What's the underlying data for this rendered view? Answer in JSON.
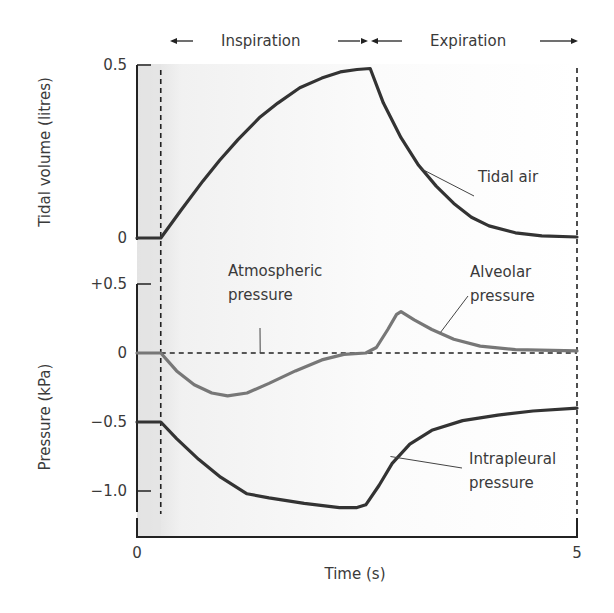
{
  "chart_data": {
    "type": "line",
    "title": "",
    "phases": [
      {
        "label": "Inspiration",
        "start": 0.27,
        "end": 2.65
      },
      {
        "label": "Expiration",
        "start": 2.65,
        "end": 5
      }
    ],
    "xlabel": "Time (s)",
    "xlim": [
      0,
      5
    ],
    "xticks": [
      {
        "value": 0,
        "label": "0"
      },
      {
        "value": 5,
        "label": "5"
      }
    ],
    "grid": false,
    "shaded_region": {
      "from": 0,
      "to": 0.27,
      "color": "#e4e4e4"
    },
    "panels": [
      {
        "id": "volume",
        "ylabel": "Tidal volume (litres)",
        "ylim": [
          0,
          0.5
        ],
        "yticks": [
          {
            "value": 0.5,
            "label": "0.5"
          },
          {
            "value": 0,
            "label": "0"
          }
        ],
        "series": [
          {
            "name": "Tidal air",
            "color": "#333333",
            "points": [
              [
                0,
                0
              ],
              [
                0.27,
                0
              ],
              [
                0.5,
                0.08
              ],
              [
                0.75,
                0.165
              ],
              [
                0.94,
                0.225
              ],
              [
                1.15,
                0.285
              ],
              [
                1.4,
                0.35
              ],
              [
                1.6,
                0.39
              ],
              [
                1.85,
                0.434
              ],
              [
                2.1,
                0.462
              ],
              [
                2.31,
                0.48
              ],
              [
                2.5,
                0.487
              ],
              [
                2.65,
                0.49
              ],
              [
                2.8,
                0.39
              ],
              [
                3.0,
                0.29
              ],
              [
                3.2,
                0.21
              ],
              [
                3.4,
                0.15
              ],
              [
                3.6,
                0.1
              ],
              [
                3.8,
                0.06
              ],
              [
                4.0,
                0.035
              ],
              [
                4.3,
                0.015
              ],
              [
                4.6,
                0.006
              ],
              [
                5.0,
                0.003
              ]
            ]
          }
        ],
        "annotations": [
          {
            "text": [
              "Tidal air"
            ],
            "anchor_value": [
              3.23,
              0.2
            ]
          }
        ]
      },
      {
        "id": "pressure",
        "ylabel": "Pressure (kPa)",
        "ylim": [
          -1.15,
          0.5
        ],
        "yticks": [
          {
            "value": 0.5,
            "label": "+0.5"
          },
          {
            "value": 0,
            "label": "0"
          },
          {
            "value": -0.5,
            "label": "−0.5"
          },
          {
            "value": -1.0,
            "label": "−1.0"
          }
        ],
        "reference_line": {
          "name": "Atmospheric pressure",
          "value": 0
        },
        "series": [
          {
            "name": "Alveolar pressure",
            "color": "#777777",
            "points": [
              [
                0,
                0
              ],
              [
                0.27,
                0
              ],
              [
                0.45,
                -0.13
              ],
              [
                0.65,
                -0.23
              ],
              [
                0.85,
                -0.29
              ],
              [
                1.03,
                -0.31
              ],
              [
                1.25,
                -0.29
              ],
              [
                1.5,
                -0.22
              ],
              [
                1.8,
                -0.13
              ],
              [
                2.1,
                -0.05
              ],
              [
                2.35,
                -0.01
              ],
              [
                2.6,
                0.0
              ],
              [
                2.72,
                0.04
              ],
              [
                2.85,
                0.17
              ],
              [
                2.95,
                0.28
              ],
              [
                3.0,
                0.3
              ],
              [
                3.15,
                0.24
              ],
              [
                3.35,
                0.17
              ],
              [
                3.6,
                0.1
              ],
              [
                3.9,
                0.05
              ],
              [
                4.3,
                0.025
              ],
              [
                5.0,
                0.015
              ]
            ]
          },
          {
            "name": "Intrapleural pressure",
            "color": "#333333",
            "points": [
              [
                0,
                -0.5
              ],
              [
                0.27,
                -0.5
              ],
              [
                0.45,
                -0.62
              ],
              [
                0.7,
                -0.77
              ],
              [
                0.95,
                -0.9
              ],
              [
                1.25,
                -1.02
              ],
              [
                1.5,
                -1.05
              ],
              [
                1.9,
                -1.09
              ],
              [
                2.3,
                -1.12
              ],
              [
                2.5,
                -1.12
              ],
              [
                2.6,
                -1.1
              ],
              [
                2.75,
                -0.96
              ],
              [
                2.9,
                -0.8
              ],
              [
                3.1,
                -0.66
              ],
              [
                3.35,
                -0.56
              ],
              [
                3.7,
                -0.49
              ],
              [
                4.1,
                -0.45
              ],
              [
                4.5,
                -0.42
              ],
              [
                5.0,
                -0.4
              ]
            ]
          }
        ],
        "annotations": [
          {
            "text": [
              "Atmospheric",
              "pressure"
            ],
            "anchor_value": [
              1.4,
              0
            ]
          },
          {
            "text": [
              "Alveolar",
              "pressure"
            ],
            "anchor_value": [
              3.45,
              0.15
            ]
          },
          {
            "text": [
              "Intrapleural",
              "pressure"
            ],
            "anchor_value": [
              2.88,
              -0.75
            ]
          }
        ]
      }
    ]
  }
}
